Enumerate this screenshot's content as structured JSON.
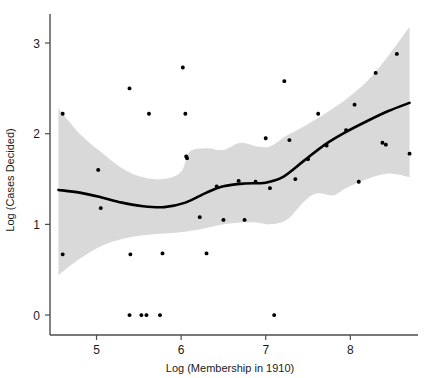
{
  "chart_data": {
    "type": "scatter",
    "title": "",
    "xlabel": "Log (Membership in 1910)",
    "ylabel": "Log (Cases Decided)",
    "xlim": [
      4.45,
      8.8
    ],
    "ylim": [
      -0.22,
      3.32
    ],
    "xticks": [
      5,
      6,
      7,
      8
    ],
    "xticklabels": [
      "5",
      "6",
      "7",
      "8"
    ],
    "yticks": [
      0,
      1,
      2,
      3
    ],
    "yticklabels": [
      "0",
      "1",
      "2",
      "3"
    ],
    "grid": false,
    "legend": null,
    "points": [
      {
        "x": 4.6,
        "y": 2.22
      },
      {
        "x": 4.6,
        "y": 0.67
      },
      {
        "x": 5.02,
        "y": 1.6
      },
      {
        "x": 5.05,
        "y": 1.18
      },
      {
        "x": 5.39,
        "y": 2.5
      },
      {
        "x": 5.39,
        "y": 0.0
      },
      {
        "x": 5.4,
        "y": 0.67
      },
      {
        "x": 5.53,
        "y": 0.0
      },
      {
        "x": 5.59,
        "y": 0.0
      },
      {
        "x": 5.62,
        "y": 2.22
      },
      {
        "x": 5.75,
        "y": 0.0
      },
      {
        "x": 5.78,
        "y": 0.68
      },
      {
        "x": 6.02,
        "y": 2.73
      },
      {
        "x": 6.05,
        "y": 2.22
      },
      {
        "x": 6.06,
        "y": 1.75
      },
      {
        "x": 6.07,
        "y": 1.73
      },
      {
        "x": 6.22,
        "y": 1.08
      },
      {
        "x": 6.3,
        "y": 0.68
      },
      {
        "x": 6.42,
        "y": 1.42
      },
      {
        "x": 6.5,
        "y": 1.05
      },
      {
        "x": 6.68,
        "y": 1.48
      },
      {
        "x": 6.75,
        "y": 1.05
      },
      {
        "x": 6.88,
        "y": 1.47
      },
      {
        "x": 7.0,
        "y": 1.95
      },
      {
        "x": 7.05,
        "y": 1.4
      },
      {
        "x": 7.1,
        "y": 0.0
      },
      {
        "x": 7.22,
        "y": 2.58
      },
      {
        "x": 7.28,
        "y": 1.93
      },
      {
        "x": 7.35,
        "y": 1.5
      },
      {
        "x": 7.5,
        "y": 1.72
      },
      {
        "x": 7.62,
        "y": 2.22
      },
      {
        "x": 7.72,
        "y": 1.87
      },
      {
        "x": 7.95,
        "y": 2.04
      },
      {
        "x": 8.05,
        "y": 2.32
      },
      {
        "x": 8.1,
        "y": 1.47
      },
      {
        "x": 8.3,
        "y": 2.67
      },
      {
        "x": 8.38,
        "y": 1.9
      },
      {
        "x": 8.42,
        "y": 1.88
      },
      {
        "x": 8.55,
        "y": 2.88
      },
      {
        "x": 8.7,
        "y": 1.78
      }
    ],
    "fit_line": [
      {
        "x": 4.55,
        "y": 1.38
      },
      {
        "x": 4.8,
        "y": 1.35
      },
      {
        "x": 5.05,
        "y": 1.3
      },
      {
        "x": 5.3,
        "y": 1.24
      },
      {
        "x": 5.55,
        "y": 1.2
      },
      {
        "x": 5.8,
        "y": 1.19
      },
      {
        "x": 6.05,
        "y": 1.24
      },
      {
        "x": 6.3,
        "y": 1.35
      },
      {
        "x": 6.5,
        "y": 1.42
      },
      {
        "x": 6.75,
        "y": 1.45
      },
      {
        "x": 7.0,
        "y": 1.46
      },
      {
        "x": 7.2,
        "y": 1.52
      },
      {
        "x": 7.45,
        "y": 1.7
      },
      {
        "x": 7.7,
        "y": 1.88
      },
      {
        "x": 7.95,
        "y": 2.02
      },
      {
        "x": 8.2,
        "y": 2.14
      },
      {
        "x": 8.45,
        "y": 2.25
      },
      {
        "x": 8.7,
        "y": 2.34
      }
    ],
    "ci_upper": [
      {
        "x": 4.55,
        "y": 2.28
      },
      {
        "x": 4.8,
        "y": 2.0
      },
      {
        "x": 5.05,
        "y": 1.8
      },
      {
        "x": 5.3,
        "y": 1.62
      },
      {
        "x": 5.55,
        "y": 1.52
      },
      {
        "x": 5.8,
        "y": 1.5
      },
      {
        "x": 6.0,
        "y": 1.58
      },
      {
        "x": 6.1,
        "y": 1.8
      },
      {
        "x": 6.3,
        "y": 1.84
      },
      {
        "x": 6.5,
        "y": 1.82
      },
      {
        "x": 6.7,
        "y": 1.9
      },
      {
        "x": 6.9,
        "y": 1.86
      },
      {
        "x": 7.05,
        "y": 1.86
      },
      {
        "x": 7.25,
        "y": 1.98
      },
      {
        "x": 7.45,
        "y": 2.08
      },
      {
        "x": 7.7,
        "y": 2.22
      },
      {
        "x": 7.95,
        "y": 2.38
      },
      {
        "x": 8.2,
        "y": 2.58
      },
      {
        "x": 8.45,
        "y": 2.86
      },
      {
        "x": 8.7,
        "y": 3.18
      }
    ],
    "ci_lower": [
      {
        "x": 4.55,
        "y": 0.44
      },
      {
        "x": 4.8,
        "y": 0.62
      },
      {
        "x": 5.05,
        "y": 0.76
      },
      {
        "x": 5.3,
        "y": 0.84
      },
      {
        "x": 5.55,
        "y": 0.88
      },
      {
        "x": 5.8,
        "y": 0.9
      },
      {
        "x": 6.05,
        "y": 0.92
      },
      {
        "x": 6.3,
        "y": 0.96
      },
      {
        "x": 6.5,
        "y": 1.0
      },
      {
        "x": 6.7,
        "y": 1.02
      },
      {
        "x": 6.9,
        "y": 1.02
      },
      {
        "x": 7.05,
        "y": 1.0
      },
      {
        "x": 7.25,
        "y": 1.05
      },
      {
        "x": 7.45,
        "y": 1.25
      },
      {
        "x": 7.6,
        "y": 1.34
      },
      {
        "x": 7.8,
        "y": 1.32
      },
      {
        "x": 7.95,
        "y": 1.4
      },
      {
        "x": 8.2,
        "y": 1.5
      },
      {
        "x": 8.45,
        "y": 1.56
      },
      {
        "x": 8.7,
        "y": 1.52
      }
    ]
  }
}
